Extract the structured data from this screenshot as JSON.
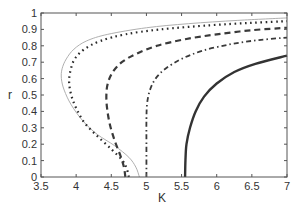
{
  "chart_data": {
    "type": "line",
    "title": "",
    "xlabel": "K",
    "ylabel": "r",
    "xlim": [
      3.5,
      7
    ],
    "ylim": [
      0,
      1
    ],
    "grid": false,
    "legend": null,
    "xticks": [
      "3.5",
      "4",
      "4.5",
      "5",
      "5.5",
      "6",
      "6.5",
      "7"
    ],
    "yticks": [
      "0",
      "0.1",
      "0.2",
      "0.3",
      "0.4",
      "0.5",
      "0.6",
      "0.7",
      "0.8",
      "0.9",
      "1"
    ],
    "series": [
      {
        "name": "thin-gray",
        "style": "solid-thin",
        "color": "#b0b0b0",
        "points": [
          [
            4.9,
            0
          ],
          [
            4.85,
            0.06
          ],
          [
            4.75,
            0.12
          ],
          [
            4.55,
            0.19
          ],
          [
            4.3,
            0.26
          ],
          [
            4.1,
            0.34
          ],
          [
            3.93,
            0.44
          ],
          [
            3.83,
            0.53
          ],
          [
            3.79,
            0.6
          ],
          [
            3.8,
            0.66
          ],
          [
            3.86,
            0.72
          ],
          [
            3.97,
            0.78
          ],
          [
            4.15,
            0.83
          ],
          [
            4.45,
            0.87
          ],
          [
            5.0,
            0.91
          ],
          [
            5.6,
            0.935
          ],
          [
            6.3,
            0.955
          ],
          [
            7.0,
            0.97
          ]
        ]
      },
      {
        "name": "dotted",
        "style": "dotted",
        "color": "#2a2a2a",
        "points": [
          [
            4.75,
            0
          ],
          [
            4.72,
            0.05
          ],
          [
            4.66,
            0.1
          ],
          [
            4.5,
            0.17
          ],
          [
            4.3,
            0.25
          ],
          [
            4.12,
            0.33
          ],
          [
            4.0,
            0.42
          ],
          [
            3.93,
            0.5
          ],
          [
            3.9,
            0.58
          ],
          [
            3.92,
            0.65
          ],
          [
            3.98,
            0.72
          ],
          [
            4.12,
            0.78
          ],
          [
            4.35,
            0.83
          ],
          [
            4.7,
            0.87
          ],
          [
            5.2,
            0.9
          ],
          [
            5.9,
            0.925
          ],
          [
            6.5,
            0.94
          ],
          [
            7.0,
            0.95
          ]
        ]
      },
      {
        "name": "dashed",
        "style": "dashed",
        "color": "#3a3a3a",
        "points": [
          [
            4.7,
            0
          ],
          [
            4.68,
            0.06
          ],
          [
            4.63,
            0.13
          ],
          [
            4.55,
            0.22
          ],
          [
            4.48,
            0.32
          ],
          [
            4.44,
            0.42
          ],
          [
            4.43,
            0.5
          ],
          [
            4.45,
            0.57
          ],
          [
            4.52,
            0.64
          ],
          [
            4.65,
            0.7
          ],
          [
            4.85,
            0.75
          ],
          [
            5.15,
            0.8
          ],
          [
            5.55,
            0.84
          ],
          [
            6.0,
            0.87
          ],
          [
            6.5,
            0.895
          ],
          [
            7.0,
            0.91
          ]
        ]
      },
      {
        "name": "dash-dot",
        "style": "dash-dot",
        "color": "#3a3a3a",
        "points": [
          [
            5.0,
            0
          ],
          [
            5.0,
            0.2
          ],
          [
            5.0,
            0.35
          ],
          [
            5.01,
            0.45
          ],
          [
            5.05,
            0.53
          ],
          [
            5.13,
            0.6
          ],
          [
            5.27,
            0.66
          ],
          [
            5.5,
            0.72
          ],
          [
            5.8,
            0.77
          ],
          [
            6.2,
            0.81
          ],
          [
            6.6,
            0.835
          ],
          [
            7.0,
            0.85
          ]
        ]
      },
      {
        "name": "solid-thick",
        "style": "solid-thick",
        "color": "#333333",
        "points": [
          [
            5.55,
            0
          ],
          [
            5.555,
            0.1
          ],
          [
            5.57,
            0.2
          ],
          [
            5.62,
            0.3
          ],
          [
            5.7,
            0.4
          ],
          [
            5.82,
            0.49
          ],
          [
            6.0,
            0.57
          ],
          [
            6.25,
            0.64
          ],
          [
            6.55,
            0.69
          ],
          [
            7.0,
            0.74
          ]
        ]
      }
    ]
  }
}
